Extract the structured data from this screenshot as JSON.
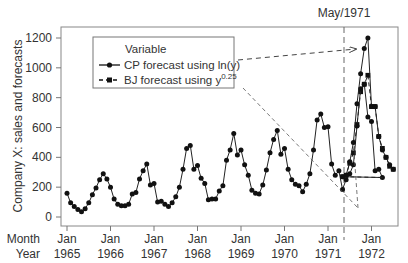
{
  "chart_data": {
    "type": "line",
    "title": "",
    "xlabel": "Month / Year",
    "ylabel": "Company X: sales and forecasts",
    "ylim": [
      0,
      1250
    ],
    "yticks": [
      0,
      200,
      400,
      600,
      800,
      1000,
      1200
    ],
    "xtick_row1_label": "Month",
    "xtick_row2_label": "Year",
    "xticks": [
      {
        "month": "Jan",
        "year": "1965"
      },
      {
        "month": "Jan",
        "year": "1966"
      },
      {
        "month": "Jan",
        "year": "1967"
      },
      {
        "month": "Jan",
        "year": "1968"
      },
      {
        "month": "Jan",
        "year": "1969"
      },
      {
        "month": "Jan",
        "year": "1970"
      },
      {
        "month": "Jan",
        "year": "1971"
      },
      {
        "month": "Jan",
        "year": "1972"
      }
    ],
    "grid": false,
    "legend": {
      "title": "Variable",
      "position": "upper-left",
      "entries": [
        {
          "label": "CP forecast using ln(y)",
          "marker": "circle",
          "line": "solid"
        },
        {
          "label_main": "BJ forecast using y",
          "label_sup": "0.25",
          "marker": "square",
          "line": "dashed"
        }
      ]
    },
    "annotation": {
      "label": "May/1971",
      "type": "vertical-dashed-line",
      "x_index": 76
    },
    "x_start": "Jan 1965",
    "series": [
      {
        "name": "Company X sales (1965–Apr 1971)",
        "start_index": 0,
        "values": [
          160,
          95,
          70,
          50,
          35,
          55,
          95,
          150,
          195,
          250,
          290,
          255,
          200,
          120,
          85,
          75,
          75,
          85,
          155,
          165,
          255,
          310,
          355,
          215,
          225,
          100,
          105,
          85,
          70,
          95,
          135,
          200,
          320,
          460,
          480,
          320,
          345,
          260,
          225,
          115,
          120,
          120,
          175,
          210,
          380,
          450,
          560,
          415,
          450,
          350,
          280,
          180,
          160,
          155,
          215,
          315,
          430,
          520,
          580,
          420,
          460,
          320,
          250,
          220,
          210,
          170,
          220,
          290,
          450,
          650,
          690,
          600,
          605,
          355,
          280,
          310,
          185,
          250,
          290,
          350,
          610,
          860,
          890,
          670,
          640,
          310,
          320,
          265
        ]
      },
      {
        "name": "CP forecast using ln(y)",
        "start_index": 76,
        "values": [
          270,
          280,
          370,
          500,
          760,
          960,
          1130,
          1200,
          740,
          740,
          540,
          450,
          400,
          350,
          320
        ]
      },
      {
        "name": "BJ forecast using y^0.25",
        "start_index": 76,
        "values": [
          270,
          280,
          360,
          430,
          620,
          840,
          890,
          950,
          740,
          740,
          540,
          460,
          400,
          340,
          320
        ]
      }
    ],
    "arrows": [
      {
        "from": "legend CP entry",
        "to_index": 82,
        "style": "dashed"
      },
      {
        "from": "legend BJ entry",
        "to_index": 81,
        "style": "dashed",
        "to_value": 60
      }
    ]
  }
}
